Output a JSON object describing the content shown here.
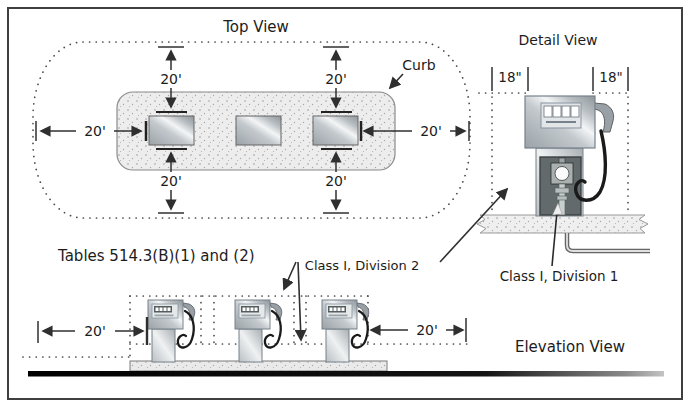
{
  "figure": {
    "type": "code-diagram"
  },
  "views": {
    "top": {
      "title": "Top View",
      "curb_label": "Curb"
    },
    "detail": {
      "title": "Detail View"
    },
    "elevation": {
      "title": "Elevation View"
    }
  },
  "annotations": {
    "tables_note": "Tables 514.3(B)(1) and (2)",
    "class_i_division_2": "Class I, Division 2",
    "class_i_division_1": "Class I, Division 1"
  },
  "dimensions": {
    "setback_20ft": "20'",
    "side_18in": "18\""
  },
  "colors": {
    "frame": "#3f3f3f",
    "line": "#2f2f2f",
    "dotted_zone": "#4a4a4a",
    "island_fill": "#ededed",
    "equipment_panel": "#636a6b",
    "hose": "#1a1a1a",
    "ground": "#0a0a0a"
  }
}
